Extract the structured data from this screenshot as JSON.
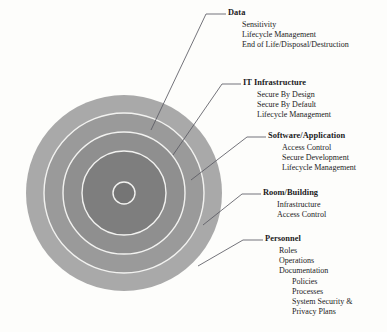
{
  "diagram": {
    "title_hidden": "",
    "colors": {
      "background": "#fdfdfb",
      "ring_1_outer": "#a9a9a9",
      "ring_2": "#9a9a9a",
      "ring_3": "#8f8f8f",
      "ring_4": "#7e7e7e",
      "ring_5_center": "#757575",
      "separator": "#f2f2f0",
      "leader_line": "#5b5b63",
      "text": "#1b1b1b"
    },
    "circle": {
      "center_x": 124,
      "center_y": 193,
      "radii": [
        98,
        80,
        61,
        42,
        11
      ]
    },
    "layers": [
      {
        "id": "data",
        "title": "Data",
        "items": [
          {
            "text": "Sensitivity",
            "level": 1
          },
          {
            "text": "Lifecycle Management",
            "level": 1
          },
          {
            "text": "End of Life/Disposal/Destruction",
            "level": 1
          }
        ],
        "leader": {
          "x1": 151,
          "y1": 130,
          "x2": 206,
          "y2": 14,
          "x3": 226,
          "y3": 14
        }
      },
      {
        "id": "it-infrastructure",
        "title": "IT Infrastructure",
        "items": [
          {
            "text": "Secure By Design",
            "level": 1
          },
          {
            "text": "Secure By Default",
            "level": 1
          },
          {
            "text": "Lifecycle Management",
            "level": 1
          }
        ],
        "leader": {
          "x1": 173,
          "y1": 155,
          "x2": 222,
          "y2": 84,
          "x3": 241,
          "y3": 84
        }
      },
      {
        "id": "software-application",
        "title": "Software/Application",
        "items": [
          {
            "text": "Access Control",
            "level": 1
          },
          {
            "text": "Secure Development",
            "level": 1
          },
          {
            "text": "Lifecycle Management",
            "level": 1
          }
        ],
        "leader": {
          "x1": 191,
          "y1": 180,
          "x2": 247,
          "y2": 137,
          "x3": 266,
          "y3": 137
        }
      },
      {
        "id": "room-building",
        "title": "Room/Building",
        "items": [
          {
            "text": "Infrastructure",
            "level": 1
          },
          {
            "text": "Access Control",
            "level": 1
          }
        ],
        "leader": {
          "x1": 203,
          "y1": 225,
          "x2": 242,
          "y2": 194,
          "x3": 261,
          "y3": 194
        }
      },
      {
        "id": "personnel",
        "title": "Personnel",
        "items": [
          {
            "text": "Roles",
            "level": 1
          },
          {
            "text": "Operations",
            "level": 1
          },
          {
            "text": "Documentation",
            "level": 1
          },
          {
            "text": "Policies",
            "level": 2
          },
          {
            "text": "Processes",
            "level": 2
          },
          {
            "text": "System Security &",
            "level": 2
          },
          {
            "text": "Privacy Plans",
            "level": 2
          }
        ],
        "leader": {
          "x1": 198,
          "y1": 266,
          "x2": 243,
          "y2": 240,
          "x3": 263,
          "y3": 240
        }
      }
    ]
  }
}
